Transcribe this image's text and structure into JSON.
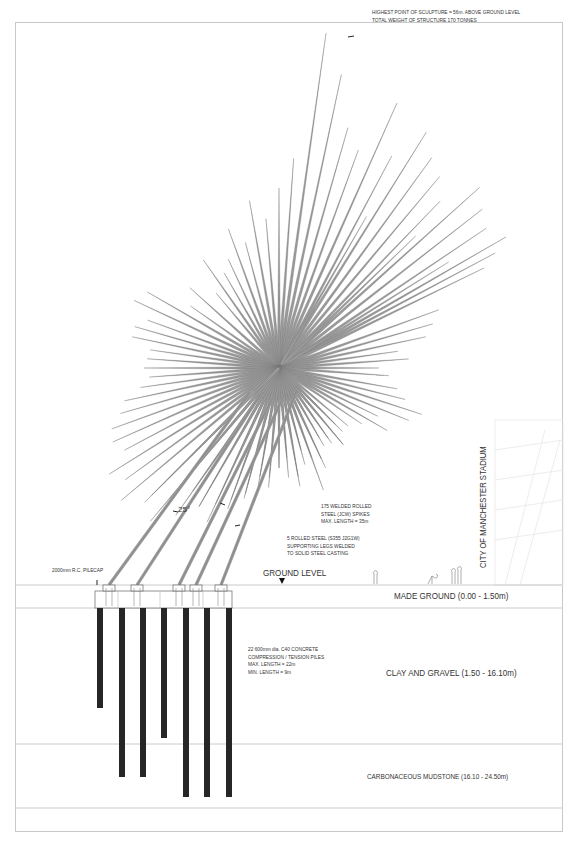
{
  "drawing": {
    "title_note": {
      "line1": "HIGHEST POINT OF SCULPTURE = 56m. ABOVE GROUND LEVEL",
      "line2": "TOTAL WEIGHT OF STRUCTURE 170 TONNES"
    },
    "spikes_note": {
      "line1": "175 WELDED ROLLED",
      "line2": "STEEL (JCW) SPIKES",
      "line3": "MAX. LENGTH = 35m"
    },
    "legs_note": {
      "line1": "5 ROLLED STEEL (S355 J2G1W)",
      "line2": "SUPPORTING LEGS WELDED",
      "line3": "TO SOLID STEEL CASTING"
    },
    "pilecap_label": "2000mm R.C. PILECAP",
    "angle_label": "25°",
    "ground_level_label": "GROUND LEVEL",
    "piles_note": {
      "line1": "22 600mm dia. C40 CONCRETE",
      "line2": "COMPRESSION / TENSION PILES",
      "line3": "MAX. LENGTH = 22m",
      "line4": "MIN. LENGTH = 9m"
    },
    "stadium_label": "CITY OF MANCHESTER STADIUM",
    "layers": [
      {
        "name": "MADE GROUND (0.00 - 1.50m)"
      },
      {
        "name": "CLAY AND GRAVEL (1.50 - 16.10m)"
      },
      {
        "name": "CARBONACEOUS MUDSTONE (16.10 - 24.50m)"
      }
    ]
  },
  "colors": {
    "spike": "#9a9a9a",
    "spike_edge": "#6e6e6e",
    "pile": "#262626",
    "line": "#bdbdbd",
    "text": "#333333"
  },
  "geometry": {
    "center": [
      279,
      368
    ],
    "spikes": [
      [
        -82,
        338
      ],
      [
        -78,
        300
      ],
      [
        -74,
        250
      ],
      [
        -70,
        232
      ],
      [
        -86,
        210
      ],
      [
        -66,
        290
      ],
      [
        -62,
        240
      ],
      [
        -58,
        278
      ],
      [
        -54,
        260
      ],
      [
        -50,
        250
      ],
      [
        -46,
        232
      ],
      [
        -42,
        270
      ],
      [
        -38,
        258
      ],
      [
        -34,
        250
      ],
      [
        -30,
        262
      ],
      [
        -28,
        245
      ],
      [
        -26,
        228
      ],
      [
        -32,
        200
      ],
      [
        -44,
        190
      ],
      [
        -60,
        175
      ],
      [
        -90,
        180
      ],
      [
        -95,
        150
      ],
      [
        -100,
        170
      ],
      [
        -105,
        130
      ],
      [
        -110,
        148
      ],
      [
        -115,
        120
      ],
      [
        -120,
        110
      ],
      [
        -125,
        132
      ],
      [
        -130,
        98
      ],
      [
        -138,
        120
      ],
      [
        -145,
        108
      ],
      [
        -150,
        152
      ],
      [
        -155,
        160
      ],
      [
        -160,
        140
      ],
      [
        -164,
        150
      ],
      [
        -168,
        150
      ],
      [
        -172,
        130
      ],
      [
        -176,
        132
      ],
      [
        -180,
        135
      ],
      [
        -184,
        130
      ],
      [
        -188,
        140
      ],
      [
        -192,
        158
      ],
      [
        -196,
        165
      ],
      [
        -200,
        178
      ],
      [
        -204,
        182
      ],
      [
        -208,
        175
      ],
      [
        -212,
        200
      ],
      [
        -216,
        190
      ],
      [
        -220,
        206
      ],
      [
        -225,
        180
      ],
      [
        -230,
        170
      ],
      [
        -235,
        150
      ],
      [
        -240,
        160
      ],
      [
        -245,
        150
      ],
      [
        -250,
        140
      ],
      [
        -255,
        135
      ],
      [
        -260,
        120
      ],
      [
        -265,
        110
      ],
      [
        -270,
        100
      ],
      [
        -275,
        110
      ],
      [
        -280,
        120
      ],
      [
        -285,
        100
      ],
      [
        -290,
        130
      ],
      [
        -295,
        110
      ],
      [
        -300,
        80
      ],
      [
        -305,
        92
      ],
      [
        -310,
        100
      ],
      [
        -315,
        90
      ],
      [
        -20,
        170
      ],
      [
        -16,
        160
      ],
      [
        -12,
        150
      ],
      [
        -8,
        120
      ],
      [
        -4,
        130
      ],
      [
        0,
        100
      ],
      [
        4,
        110
      ],
      [
        10,
        120
      ],
      [
        14,
        130
      ],
      [
        18,
        150
      ],
      [
        22,
        140
      ],
      [
        26,
        110
      ],
      [
        30,
        125
      ],
      [
        34,
        100
      ],
      [
        40,
        90
      ],
      [
        45,
        80
      ],
      [
        50,
        100
      ],
      [
        55,
        86
      ],
      [
        60,
        90
      ],
      [
        65,
        100
      ],
      [
        70,
        95
      ],
      [
        75,
        85
      ],
      [
        80,
        110
      ],
      [
        85,
        90
      ],
      [
        90,
        100
      ],
      [
        95,
        120
      ],
      [
        100,
        110
      ],
      [
        105,
        130
      ],
      [
        110,
        150
      ],
      [
        115,
        170
      ],
      [
        120,
        160
      ],
      [
        125,
        180
      ],
      [
        130,
        200
      ],
      [
        135,
        190
      ]
    ],
    "legs": [
      {
        "from": [
          109,
          585
        ],
        "to": [
          250,
          392
        ]
      },
      {
        "from": [
          137,
          585
        ],
        "to": [
          262,
          392
        ]
      },
      {
        "from": [
          179,
          585
        ],
        "to": [
          274,
          395
        ]
      },
      {
        "from": [
          196,
          585
        ],
        "to": [
          284,
          395
        ]
      },
      {
        "from": [
          221,
          585
        ],
        "to": [
          296,
          392
        ]
      }
    ],
    "piles": [
      {
        "x": 97,
        "bottom": 708
      },
      {
        "x": 119,
        "bottom": 777
      },
      {
        "x": 140,
        "bottom": 777
      },
      {
        "x": 161,
        "bottom": 738
      },
      {
        "x": 183,
        "bottom": 797
      },
      {
        "x": 204,
        "bottom": 797
      },
      {
        "x": 226,
        "bottom": 797
      }
    ],
    "layer_lines": [
      585,
      608,
      744,
      808
    ]
  }
}
